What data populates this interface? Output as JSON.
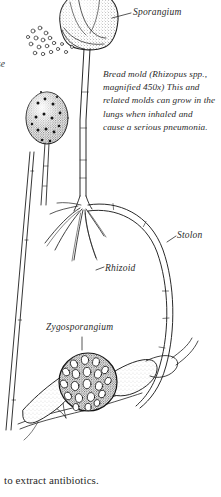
{
  "figure": {
    "kind": "scientific-ink-illustration",
    "ink_color": "#1f1f1f",
    "paper_color": "#ffffff",
    "caption": "Bread mold (Rhizopus spp., magnified 450x) This and related molds can grow in the lungs when inhaled and cause a serious pneumonia.",
    "labels": [
      {
        "id": "sporangium",
        "text": "Sporangium"
      },
      {
        "id": "stolon",
        "text": "Stolon"
      },
      {
        "id": "rhizoid",
        "text": "Rhizoid"
      },
      {
        "id": "zygosporangium",
        "text": "Zygosporangium"
      }
    ],
    "edge_text": "se",
    "body_line": "to extract antibiotics."
  }
}
